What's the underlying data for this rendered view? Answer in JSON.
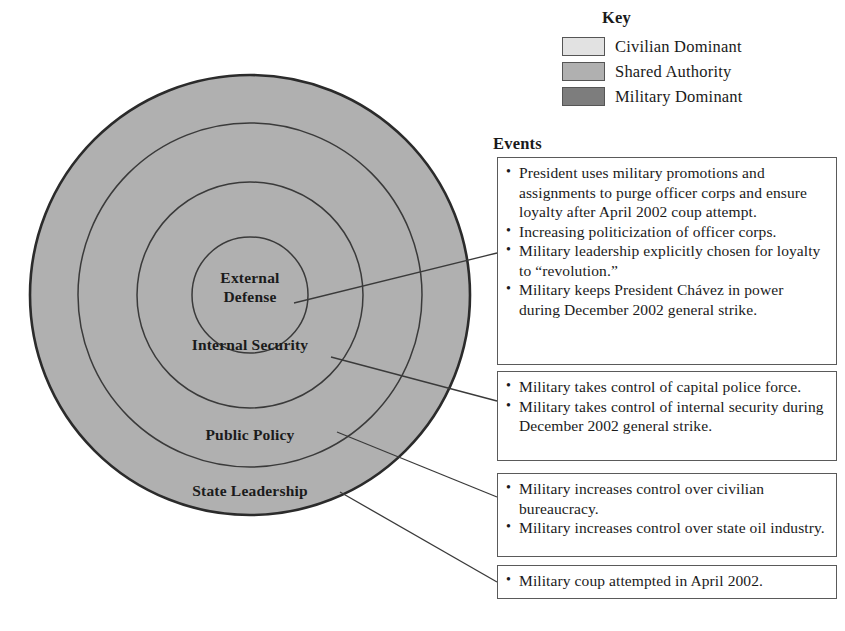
{
  "diagram": {
    "rings": [
      {
        "id": "state-leadership",
        "label": "State Leadership",
        "shade": "shared-authority"
      },
      {
        "id": "public-policy",
        "label": "Public Policy",
        "shade": "shared-authority"
      },
      {
        "id": "internal-security",
        "label": "Internal Security",
        "shade": "shared-authority"
      },
      {
        "id": "external-defense",
        "label": "External Defense",
        "shade": "shared-authority"
      }
    ],
    "ring_label_lines": {
      "external_defense_line1": "External",
      "external_defense_line2": "Defense",
      "internal_security": "Internal Security",
      "public_policy": "Public Policy",
      "state_leadership": "State Leadership"
    }
  },
  "key": {
    "title": "Key",
    "items": [
      {
        "label": "Civilian Dominant",
        "color": "#e2e2e2"
      },
      {
        "label": "Shared Authority",
        "color": "#b0b0b0"
      },
      {
        "label": "Military Dominant",
        "color": "#7d7d7d"
      }
    ]
  },
  "events": {
    "title": "Events",
    "boxes": [
      {
        "id": "external-defense-events",
        "items": [
          "President uses military promotions and assignments to purge officer corps and ensure loyalty after April 2002 coup attempt.",
          "Increasing politicization of officer corps.",
          "Military leadership explicitly chosen for loyalty to “revolution.”",
          "Military keeps President Chávez in power during December 2002 general strike."
        ]
      },
      {
        "id": "internal-security-events",
        "items": [
          "Military takes control of capital police force.",
          "Military takes control of internal security during December 2002 general strike."
        ]
      },
      {
        "id": "public-policy-events",
        "items": [
          "Military increases control over civilian bureaucracy.",
          "Military increases control over state oil industry."
        ]
      },
      {
        "id": "state-leadership-events",
        "items": [
          "Military coup attempted in April 2002."
        ]
      }
    ]
  },
  "colors": {
    "ring_fill": "#b0b0b0",
    "ring_stroke": "#2b2b2b",
    "box_stroke": "#5a5a5a",
    "text": "#1a1a1a",
    "background": "#ffffff"
  }
}
